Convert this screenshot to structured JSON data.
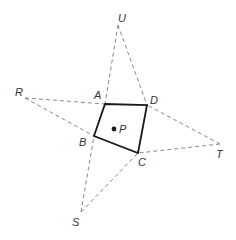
{
  "diagram": {
    "points": {
      "U": {
        "label": "U",
        "x": 118,
        "y": 25,
        "lx": 118,
        "ly": 22
      },
      "R": {
        "label": "R",
        "x": 25,
        "y": 98,
        "lx": 15,
        "ly": 96
      },
      "T": {
        "label": "T",
        "x": 220,
        "y": 144,
        "lx": 216,
        "ly": 158
      },
      "S": {
        "label": "S",
        "x": 81,
        "y": 212,
        "lx": 72,
        "ly": 226
      },
      "A": {
        "label": "A",
        "x": 105,
        "y": 104,
        "lx": 94,
        "ly": 99
      },
      "D": {
        "label": "D",
        "x": 147,
        "y": 105,
        "lx": 150,
        "ly": 104
      },
      "B": {
        "label": "B",
        "x": 94,
        "y": 136,
        "lx": 79,
        "ly": 146
      },
      "C": {
        "label": "C",
        "x": 138,
        "y": 153,
        "lx": 138,
        "ly": 166
      },
      "P": {
        "label": "P",
        "x": 114,
        "y": 129,
        "lx": 119,
        "ly": 133
      }
    },
    "quadrilateral": [
      "A",
      "D",
      "C",
      "B"
    ],
    "dashed_segments": [
      [
        "U",
        "A"
      ],
      [
        "U",
        "D"
      ],
      [
        "R",
        "A"
      ],
      [
        "R",
        "B"
      ],
      [
        "T",
        "D"
      ],
      [
        "T",
        "C"
      ],
      [
        "S",
        "B"
      ],
      [
        "S",
        "C"
      ]
    ],
    "colors": {
      "solid": "#1a1a1a",
      "dashed": "#7a7a7a",
      "label": "#333333"
    }
  }
}
